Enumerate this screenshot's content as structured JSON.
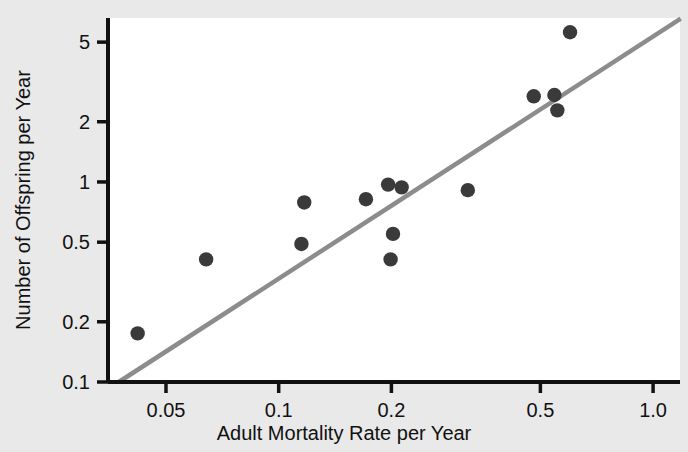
{
  "chart_data": {
    "type": "scatter",
    "title": "",
    "xlabel": "Adult Mortality Rate per Year",
    "ylabel": "Number of Offspring per Year",
    "xscale": "log",
    "yscale": "log",
    "xlim": [
      0.035,
      1.18
    ],
    "ylim": [
      0.1,
      6.6
    ],
    "grid": false,
    "legend": null,
    "xticks": [
      {
        "value": 0.05,
        "label": "0.05"
      },
      {
        "value": 0.1,
        "label": "0.1"
      },
      {
        "value": 0.2,
        "label": "0.2"
      },
      {
        "value": 0.5,
        "label": "0.5"
      },
      {
        "value": 1.0,
        "label": "1.0"
      }
    ],
    "yticks": [
      {
        "value": 5,
        "label": "5"
      },
      {
        "value": 2,
        "label": "2"
      },
      {
        "value": 1,
        "label": "1"
      },
      {
        "value": 0.5,
        "label": "0.5"
      },
      {
        "value": 0.2,
        "label": "0.2"
      },
      {
        "value": 0.1,
        "label": "0.1"
      }
    ],
    "points": [
      {
        "x": 0.042,
        "y": 0.175
      },
      {
        "x": 0.064,
        "y": 0.41
      },
      {
        "x": 0.115,
        "y": 0.49
      },
      {
        "x": 0.117,
        "y": 0.79
      },
      {
        "x": 0.171,
        "y": 0.82
      },
      {
        "x": 0.196,
        "y": 0.97
      },
      {
        "x": 0.199,
        "y": 0.41
      },
      {
        "x": 0.202,
        "y": 0.55
      },
      {
        "x": 0.213,
        "y": 0.94
      },
      {
        "x": 0.32,
        "y": 0.91
      },
      {
        "x": 0.48,
        "y": 2.68
      },
      {
        "x": 0.545,
        "y": 2.72
      },
      {
        "x": 0.555,
        "y": 2.28
      },
      {
        "x": 0.6,
        "y": 5.6
      }
    ],
    "trendline": {
      "style": "solid",
      "color": "#8c8c8c",
      "x_start": 0.0374,
      "y_start": 0.1,
      "x_end": 1.185,
      "y_end": 6.55
    },
    "colors": {
      "background": "#e9e9e9",
      "plot_area": "#ffffff",
      "axis": "#111111",
      "point": "#3a3a3a",
      "trendline": "#8c8c8c",
      "text": "#111111"
    }
  }
}
